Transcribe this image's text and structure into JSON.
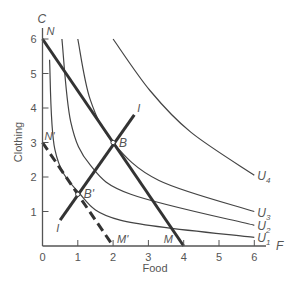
{
  "chart_data": {
    "type": "line",
    "title": "",
    "xlabel": "Food",
    "ylabel": "Clothing",
    "x_axis_letter": "F",
    "y_axis_letter": "C",
    "xlim": [
      0,
      6.5
    ],
    "ylim": [
      0,
      6.3
    ],
    "x_ticks": [
      "0",
      "1",
      "2",
      "3",
      "4",
      "5",
      "6"
    ],
    "y_ticks": [
      "1",
      "2",
      "3",
      "4",
      "5",
      "6"
    ],
    "grid": false,
    "legend": "none",
    "indifference_curves": [
      {
        "name": "U1",
        "sub": "1",
        "points": [
          [
            0.2,
            5.4
          ],
          [
            0.35,
            2.8
          ],
          [
            1.0,
            1.58
          ],
          [
            2.2,
            0.75
          ],
          [
            6.0,
            0.25
          ]
        ]
      },
      {
        "name": "U2",
        "sub": "2",
        "points": [
          [
            0.55,
            6.0
          ],
          [
            0.8,
            3.6
          ],
          [
            1.35,
            2.35
          ],
          [
            2.5,
            1.5
          ],
          [
            6.0,
            0.6
          ]
        ]
      },
      {
        "name": "U3",
        "sub": "3",
        "points": [
          [
            1.0,
            6.0
          ],
          [
            1.35,
            4.25
          ],
          [
            2.0,
            3.0
          ],
          [
            3.3,
            1.9
          ],
          [
            6.0,
            1.0
          ]
        ]
      },
      {
        "name": "U4",
        "sub": "4",
        "points": [
          [
            2.0,
            6.0
          ],
          [
            3.05,
            4.5
          ],
          [
            4.2,
            3.3
          ],
          [
            6.0,
            2.05
          ]
        ]
      }
    ],
    "budget_lines": [
      {
        "name": "NM",
        "start_label": "N",
        "end_label": "M",
        "from": [
          0,
          6
        ],
        "to": [
          4,
          0
        ],
        "style": "solid"
      },
      {
        "name": "N'M'",
        "start_label": "N'",
        "end_label": "M'",
        "from": [
          0,
          3
        ],
        "to": [
          2,
          0
        ],
        "style": "dashed"
      }
    ],
    "income_consumption_line": {
      "name": "I",
      "from": [
        0.5,
        0.75
      ],
      "to": [
        2.6,
        3.8
      ],
      "label_start": "I",
      "label_end": "I"
    },
    "points": [
      {
        "label": "B",
        "x": 2,
        "y": 3
      },
      {
        "label": "B'",
        "x": 1,
        "y": 1.5
      }
    ]
  }
}
